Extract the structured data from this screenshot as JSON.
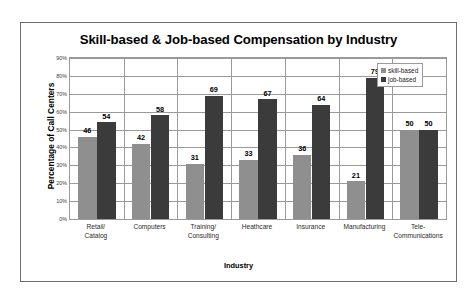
{
  "chart_data": {
    "type": "bar",
    "title": "Skill-based & Job-based Compensation by Industry",
    "xlabel": "Industry",
    "ylabel": "Percentage of Call Centers",
    "categories": [
      "Retail/ Catalog",
      "Computers",
      "Training/ Consulting",
      "Heathcare",
      "Insurance",
      "Manufacturing",
      "Tele- Communications"
    ],
    "category_lines": [
      [
        "Retail/",
        "Catalog"
      ],
      [
        "Computers",
        ""
      ],
      [
        "Training/",
        "Consulting"
      ],
      [
        "Heathcare",
        ""
      ],
      [
        "Insurance",
        ""
      ],
      [
        "Manufacturing",
        ""
      ],
      [
        "Tele-",
        "Communications"
      ]
    ],
    "series": [
      {
        "name": "skill-based",
        "color": "#8f8f8f",
        "values": [
          46,
          42,
          31,
          33,
          36,
          21,
          50
        ]
      },
      {
        "name": "job-based",
        "color": "#3b3b3b",
        "values": [
          54,
          58,
          69,
          67,
          64,
          79,
          50
        ]
      }
    ],
    "ylim": [
      0,
      90
    ],
    "ytick_values": [
      0,
      10,
      20,
      30,
      40,
      50,
      60,
      70,
      80,
      90
    ],
    "ytick_labels": [
      "0%",
      "10%",
      "20%",
      "30%",
      "40%",
      "50%",
      "60%",
      "70%",
      "80%",
      "90%"
    ],
    "grid": true,
    "legend_position": "top-right",
    "data_labels": true
  },
  "legend": {
    "items": [
      {
        "label": "skill-based",
        "swatch": "skill"
      },
      {
        "label": "job-based",
        "swatch": "job"
      }
    ]
  }
}
